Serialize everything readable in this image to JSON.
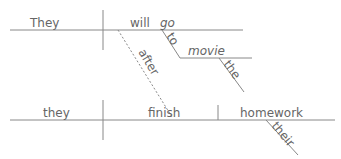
{
  "diagram": {
    "type": "sentence-diagram",
    "clauses": [
      {
        "subject": "They",
        "verb_aux": "will",
        "verb": "go",
        "modifiers": [
          {
            "preposition": "to",
            "object": "movie",
            "article": "the"
          }
        ]
      },
      {
        "connector": "after",
        "subject": "they",
        "verb": "finish",
        "object": "homework",
        "object_modifier": "their"
      }
    ],
    "colors": {
      "line": "#888888",
      "text": "#666666"
    }
  }
}
